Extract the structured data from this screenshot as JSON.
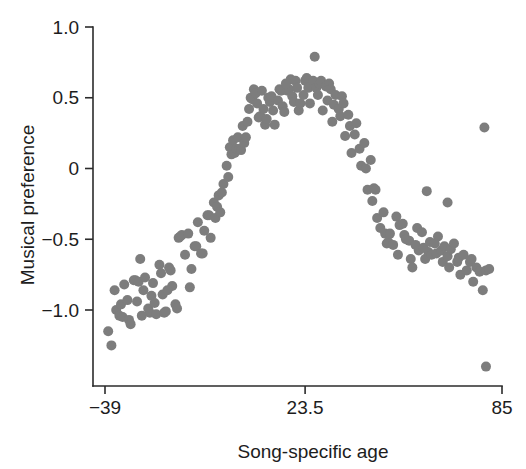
{
  "chart_data": {
    "type": "scatter",
    "title": "",
    "xlabel": "Song-specific age",
    "ylabel": "Musical preference",
    "xlim": [
      -39,
      85
    ],
    "ylim": [
      -1.45,
      1.0
    ],
    "grid": false,
    "legend": null,
    "marker": {
      "shape": "circle",
      "color": "#7d7d7d",
      "size_px": 10
    },
    "axes": {
      "x_ticks": [
        -39,
        23.5,
        85
      ],
      "x_tick_labels": [
        "−39",
        "23.5",
        "85"
      ],
      "y_ticks": [
        1.0,
        0.5,
        0,
        -0.5,
        -1.0
      ],
      "y_tick_labels": [
        "1.0",
        "0.5",
        "0",
        "−0.5",
        "−1.0"
      ]
    },
    "points": [
      [
        -38.0,
        -1.15
      ],
      [
        -37.0,
        -1.25
      ],
      [
        -36.0,
        -0.86
      ],
      [
        -35.5,
        -1.0
      ],
      [
        -34.5,
        -1.04
      ],
      [
        -34.0,
        -0.96
      ],
      [
        -33.5,
        -1.05
      ],
      [
        -33.0,
        -0.82
      ],
      [
        -32.0,
        -0.93
      ],
      [
        -31.5,
        -1.07
      ],
      [
        -31.0,
        -1.1
      ],
      [
        -30.0,
        -0.79
      ],
      [
        -29.5,
        -0.79
      ],
      [
        -29.0,
        -0.94
      ],
      [
        -28.5,
        -0.8
      ],
      [
        -28.0,
        -0.64
      ],
      [
        -27.0,
        -0.86
      ],
      [
        -26.5,
        -0.77
      ],
      [
        -25.5,
        -0.99
      ],
      [
        -25.0,
        -1.02
      ],
      [
        -24.5,
        -0.9
      ],
      [
        -24.0,
        -0.81
      ],
      [
        -23.5,
        -0.95
      ],
      [
        -23.0,
        -1.03
      ],
      [
        -22.0,
        -0.68
      ],
      [
        -21.5,
        -0.74
      ],
      [
        -21.0,
        -0.89
      ],
      [
        -20.5,
        -1.02
      ],
      [
        -20.0,
        -1.01
      ],
      [
        -19.0,
        -0.7
      ],
      [
        -18.5,
        -0.72
      ],
      [
        -18.0,
        -0.83
      ],
      [
        -17.0,
        -0.96
      ],
      [
        -16.5,
        -0.99
      ],
      [
        -16.0,
        -0.49
      ],
      [
        -15.5,
        -0.48
      ],
      [
        -15.0,
        -0.47
      ],
      [
        -14.0,
        -0.61
      ],
      [
        -13.0,
        -0.46
      ],
      [
        -12.0,
        -0.71
      ],
      [
        -11.0,
        -0.55
      ],
      [
        -10.5,
        -0.55
      ],
      [
        -10.0,
        -0.38
      ],
      [
        -9.0,
        -0.6
      ],
      [
        -8.5,
        -0.6
      ],
      [
        -8.0,
        -0.44
      ],
      [
        -7.0,
        -0.33
      ],
      [
        -6.5,
        -0.33
      ],
      [
        -6.0,
        -0.49
      ],
      [
        -5.0,
        -0.24
      ],
      [
        -4.5,
        -0.35
      ],
      [
        -4.0,
        -0.27
      ],
      [
        -3.5,
        -0.19
      ],
      [
        -3.0,
        -0.31
      ],
      [
        -2.5,
        -0.17
      ],
      [
        -2.0,
        -0.11
      ],
      [
        -1.0,
        0.02
      ],
      [
        -0.5,
        -0.06
      ],
      [
        0.0,
        0.15
      ],
      [
        0.5,
        0.1
      ],
      [
        1.0,
        0.2
      ],
      [
        1.5,
        0.11
      ],
      [
        2.0,
        0.14
      ],
      [
        2.5,
        0.22
      ],
      [
        3.0,
        0.14
      ],
      [
        3.5,
        0.13
      ],
      [
        4.0,
        0.3
      ],
      [
        4.5,
        0.18
      ],
      [
        5.0,
        0.22
      ],
      [
        6.0,
        0.42
      ],
      [
        6.5,
        0.5
      ],
      [
        7.0,
        0.49
      ],
      [
        7.5,
        0.56
      ],
      [
        8.0,
        0.53
      ],
      [
        8.5,
        0.46
      ],
      [
        9.0,
        0.36
      ],
      [
        9.5,
        0.37
      ],
      [
        10.0,
        0.55
      ],
      [
        10.5,
        0.42
      ],
      [
        11.0,
        0.31
      ],
      [
        11.5,
        0.35
      ],
      [
        12.0,
        0.5
      ],
      [
        12.5,
        0.47
      ],
      [
        13.0,
        0.51
      ],
      [
        13.5,
        0.41
      ],
      [
        14.0,
        0.31
      ],
      [
        15.0,
        0.48
      ],
      [
        15.5,
        0.56
      ],
      [
        16.0,
        0.55
      ],
      [
        16.5,
        0.44
      ],
      [
        17.0,
        0.4
      ],
      [
        18.0,
        0.55
      ],
      [
        18.5,
        0.56
      ],
      [
        19.0,
        0.63
      ],
      [
        19.5,
        0.51
      ],
      [
        20.0,
        0.47
      ],
      [
        20.5,
        0.62
      ],
      [
        21.0,
        0.57
      ],
      [
        21.5,
        0.41
      ],
      [
        22.0,
        0.46
      ],
      [
        23.0,
        0.52
      ],
      [
        23.5,
        0.62
      ],
      [
        24.0,
        0.64
      ],
      [
        24.5,
        0.57
      ],
      [
        25.0,
        0.46
      ],
      [
        26.0,
        0.62
      ],
      [
        26.5,
        0.79
      ],
      [
        27.0,
        0.57
      ],
      [
        27.5,
        0.52
      ],
      [
        28.0,
        0.6
      ],
      [
        28.5,
        0.62
      ],
      [
        29.0,
        0.41
      ],
      [
        30.0,
        0.58
      ],
      [
        30.5,
        0.48
      ],
      [
        31.0,
        0.6
      ],
      [
        31.5,
        0.56
      ],
      [
        32.0,
        0.33
      ],
      [
        32.5,
        0.45
      ],
      [
        33.0,
        0.52
      ],
      [
        34.0,
        0.42
      ],
      [
        34.5,
        0.37
      ],
      [
        35.0,
        0.51
      ],
      [
        35.5,
        0.46
      ],
      [
        36.0,
        0.23
      ],
      [
        37.0,
        0.38
      ],
      [
        37.5,
        0.3
      ],
      [
        38.0,
        0.11
      ],
      [
        39.0,
        0.24
      ],
      [
        39.5,
        0.32
      ],
      [
        40.5,
        0.14
      ],
      [
        41.0,
        0.02
      ],
      [
        42.0,
        0.18
      ],
      [
        42.5,
        0.0
      ],
      [
        43.0,
        -0.15
      ],
      [
        44.0,
        0.06
      ],
      [
        44.5,
        -0.23
      ],
      [
        45.0,
        -0.14
      ],
      [
        45.5,
        -0.15
      ],
      [
        46.0,
        -0.35
      ],
      [
        47.0,
        -0.42
      ],
      [
        48.0,
        -0.31
      ],
      [
        48.5,
        -0.46
      ],
      [
        49.0,
        -0.53
      ],
      [
        49.5,
        -0.52
      ],
      [
        50.0,
        -0.46
      ],
      [
        51.0,
        -0.54
      ],
      [
        52.0,
        -0.34
      ],
      [
        52.5,
        -0.61
      ],
      [
        53.0,
        -0.4
      ],
      [
        54.0,
        -0.39
      ],
      [
        54.5,
        -0.47
      ],
      [
        55.0,
        -0.5
      ],
      [
        56.0,
        -0.51
      ],
      [
        56.5,
        -0.64
      ],
      [
        57.0,
        -0.7
      ],
      [
        58.0,
        -0.54
      ],
      [
        58.5,
        -0.42
      ],
      [
        59.0,
        -0.58
      ],
      [
        60.0,
        -0.45
      ],
      [
        60.5,
        -0.56
      ],
      [
        61.0,
        -0.64
      ],
      [
        62.0,
        -0.59
      ],
      [
        62.5,
        -0.52
      ],
      [
        63.0,
        -0.61
      ],
      [
        64.0,
        -0.53
      ],
      [
        64.5,
        -0.6
      ],
      [
        65.0,
        -0.48
      ],
      [
        66.0,
        -0.58
      ],
      [
        66.5,
        -0.66
      ],
      [
        67.0,
        -0.55
      ],
      [
        68.0,
        -0.62
      ],
      [
        68.5,
        -0.7
      ],
      [
        69.0,
        -0.57
      ],
      [
        70.0,
        -0.53
      ],
      [
        71.0,
        -0.66
      ],
      [
        71.5,
        -0.63
      ],
      [
        72.0,
        -0.75
      ],
      [
        73.0,
        -0.61
      ],
      [
        74.0,
        -0.72
      ],
      [
        75.0,
        -0.66
      ],
      [
        75.5,
        -0.64
      ],
      [
        76.0,
        -0.8
      ],
      [
        77.0,
        -0.7
      ],
      [
        78.0,
        -0.73
      ],
      [
        79.0,
        -0.86
      ],
      [
        80.0,
        -0.72
      ],
      [
        81.0,
        -0.71
      ],
      [
        61.5,
        -0.16
      ],
      [
        68.0,
        -0.24
      ],
      [
        79.5,
        0.29
      ],
      [
        80.0,
        -1.4
      ],
      [
        5.5,
        0.33
      ],
      [
        -12.5,
        -0.84
      ],
      [
        -19.5,
        -0.86
      ],
      [
        -27.5,
        -1.04
      ],
      [
        17.5,
        0.6
      ]
    ]
  },
  "figure": {
    "background": "#ffffff",
    "axis_color": "#2b2b2b",
    "text_color": "#1d1d1d"
  }
}
